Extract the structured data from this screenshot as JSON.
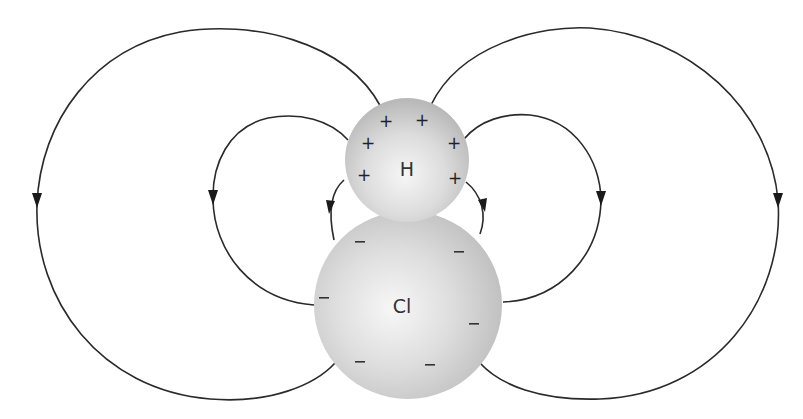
{
  "diagram": {
    "atoms": [
      {
        "id": "H",
        "label": "H",
        "charge_symbol": "+",
        "charge_count": 6,
        "cx": 407,
        "cy": 160,
        "r": 62
      },
      {
        "id": "Cl",
        "label": "Cl",
        "charge_symbol": "–",
        "charge_count": 7,
        "cx": 408,
        "cy": 305,
        "r": 94
      }
    ],
    "h_charges": [
      {
        "x": 385,
        "y": 121
      },
      {
        "x": 422,
        "y": 120
      },
      {
        "x": 368,
        "y": 143
      },
      {
        "x": 454,
        "y": 143
      },
      {
        "x": 364,
        "y": 175
      },
      {
        "x": 455,
        "y": 178
      }
    ],
    "cl_charges": [
      {
        "x": 360,
        "y": 242
      },
      {
        "x": 459,
        "y": 252
      },
      {
        "x": 324,
        "y": 298
      },
      {
        "x": 474,
        "y": 324
      },
      {
        "x": 360,
        "y": 362
      },
      {
        "x": 430,
        "y": 365
      }
    ],
    "field_lines": [
      {
        "name": "outer-left",
        "direction": "H to Cl"
      },
      {
        "name": "inner-left",
        "direction": "H to Cl"
      },
      {
        "name": "short-left",
        "direction": "H to Cl"
      },
      {
        "name": "short-right",
        "direction": "H to Cl"
      },
      {
        "name": "inner-right",
        "direction": "H to Cl"
      },
      {
        "name": "outer-right",
        "direction": "H to Cl"
      }
    ],
    "colors": {
      "line": "#2a2a2a",
      "sphere_light": "#f4f4f4",
      "sphere_dark": "#b8b8b8",
      "background": "#ffffff"
    }
  }
}
